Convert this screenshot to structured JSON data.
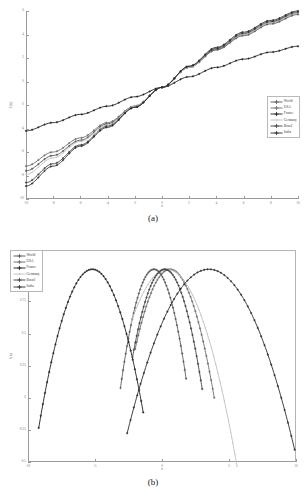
{
  "figure": {
    "panels": [
      {
        "id": "a",
        "caption": "(a)"
      },
      {
        "id": "b",
        "caption": "(b)"
      }
    ]
  },
  "legend": {
    "entries": [
      {
        "label": "World",
        "color": "#555555",
        "marker": "plus"
      },
      {
        "label": "USA",
        "color": "#6b6b6b",
        "marker": "plus"
      },
      {
        "label": "France",
        "color": "#1c1c1c",
        "marker": "plus"
      },
      {
        "label": "Germany",
        "color": "#bdbdbd",
        "marker": "dot"
      },
      {
        "label": "Brazil",
        "color": "#3d3d3d",
        "marker": "plus"
      },
      {
        "label": "India",
        "color": "#2a2a2a",
        "marker": "plus"
      }
    ]
  },
  "chart_data": [
    {
      "type": "line",
      "panel": "a",
      "title": "",
      "xlabel": "x",
      "ylabel": "F(x)",
      "xlim": [
        -10,
        10
      ],
      "ylim": [
        -10,
        6
      ],
      "xticks": [
        -10,
        -8,
        -6,
        -4,
        -2,
        0,
        2,
        4,
        6,
        8,
        10
      ],
      "xticklabels": [
        "-10",
        "-8",
        "-6",
        "-4",
        "-2",
        "0",
        "2",
        "4",
        "6",
        "8",
        "10"
      ],
      "yticks": [
        -10,
        -8,
        -6,
        -4,
        -2,
        0,
        2,
        4,
        6
      ],
      "yticklabels": [
        "-10",
        "-8",
        "-6",
        "-4",
        "-2",
        "0",
        "2",
        "4",
        "6"
      ],
      "grid": false,
      "legend_position": "right",
      "x": [
        -10,
        -8,
        -6,
        -4,
        -2,
        0,
        2,
        4,
        6,
        8,
        10
      ],
      "series": [
        {
          "name": "World",
          "color": "#555555",
          "values": [
            -7.6,
            -6.3,
            -5.0,
            -3.6,
            -2.1,
            -0.5,
            1.2,
            2.7,
            3.9,
            4.9,
            5.7
          ]
        },
        {
          "name": "USA",
          "color": "#6b6b6b",
          "values": [
            -7.2,
            -6.0,
            -4.8,
            -3.5,
            -2.1,
            -0.5,
            1.2,
            2.7,
            4.0,
            5.0,
            5.8
          ]
        },
        {
          "name": "France",
          "color": "#1c1c1c",
          "values": [
            -4.2,
            -3.5,
            -2.8,
            -2.1,
            -1.3,
            -0.5,
            0.4,
            1.2,
            1.9,
            2.5,
            3.0
          ]
        },
        {
          "name": "Germany",
          "color": "#bdbdbd",
          "values": [
            -7.9,
            -6.5,
            -5.1,
            -3.7,
            -2.1,
            -0.5,
            1.2,
            2.8,
            4.0,
            5.0,
            5.8
          ]
        },
        {
          "name": "Brazil",
          "color": "#3d3d3d",
          "values": [
            -8.6,
            -7.0,
            -5.4,
            -3.8,
            -2.2,
            -0.5,
            1.3,
            2.8,
            4.1,
            5.1,
            5.9
          ]
        },
        {
          "name": "India",
          "color": "#2a2a2a",
          "values": [
            -8.9,
            -7.2,
            -5.5,
            -3.9,
            -2.2,
            -0.5,
            1.3,
            2.9,
            4.2,
            5.2,
            6.0
          ]
        }
      ]
    },
    {
      "type": "line",
      "panel": "b",
      "title": "",
      "xlabel": "x",
      "ylabel": "f(x)",
      "xlim": [
        -10,
        10
      ],
      "ylim": [
        -0.5,
        1.15
      ],
      "xticks": [
        -10,
        -5,
        0,
        5,
        10
      ],
      "xticklabels": [
        "-10",
        "-5",
        "0",
        "5",
        "10"
      ],
      "yticks": [
        -0.5,
        -0.25,
        0,
        0.25,
        0.5,
        0.75,
        1.0
      ],
      "yticklabels": [
        "-0.5",
        "-0.25",
        "0",
        "0.25",
        "0.5",
        "0.75",
        "1"
      ],
      "grid": false,
      "legend_position": "upper left",
      "series": [
        {
          "name": "World",
          "color": "#555555",
          "peak_x": -0.6,
          "peak_y": 1.0,
          "width": 2.6,
          "x_start": -3.1,
          "x_end": 1.8
        },
        {
          "name": "USA",
          "color": "#6b6b6b",
          "peak_x": 0.6,
          "peak_y": 1.0,
          "width": 3.3,
          "x_start": -2.0,
          "x_end": 3.9
        },
        {
          "name": "France",
          "color": "#1c1c1c",
          "peak_x": -5.2,
          "peak_y": 1.0,
          "width": 3.6,
          "x_start": -9.2,
          "x_end": -1.4
        },
        {
          "name": "Germany",
          "color": "#bdbdbd",
          "peak_x": 0.4,
          "peak_y": 1.0,
          "width": 4.2,
          "x_start": -2.3,
          "x_end": 5.6
        },
        {
          "name": "Brazil",
          "color": "#3d3d3d",
          "peak_x": 0.2,
          "peak_y": 1.0,
          "width": 2.9,
          "x_start": -2.2,
          "x_end": 3.0
        },
        {
          "name": "India",
          "color": "#2a2a2a",
          "peak_x": 3.5,
          "peak_y": 1.0,
          "width": 5.4,
          "x_start": -2.6,
          "x_end": 9.9
        }
      ]
    }
  ]
}
